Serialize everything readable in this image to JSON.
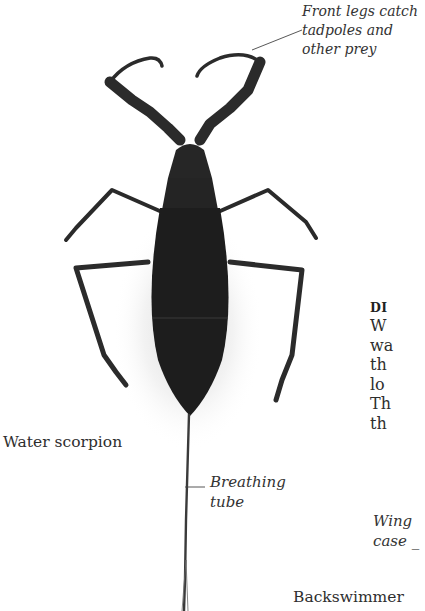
{
  "figure": {
    "colors": {
      "body": "#1f1f1f",
      "legs": "#2c2c2c",
      "shadow": "#d8d8d8",
      "background": "#ffffff"
    }
  },
  "annotations": {
    "front_legs": {
      "lines": [
        "Front legs catch",
        "tadpoles and",
        "other prey"
      ]
    },
    "breathing_tube": {
      "lines": [
        "Breathing",
        "tube"
      ]
    },
    "wing_case": {
      "lines": [
        "Wing",
        "case _"
      ]
    }
  },
  "labels": {
    "water_scorpion": "Water scorpion",
    "backswimmer": "Backswimmer"
  },
  "side_text": {
    "heading": "DI",
    "lines": [
      "W",
      "wa",
      "th",
      "lo",
      "Th",
      "th"
    ]
  }
}
